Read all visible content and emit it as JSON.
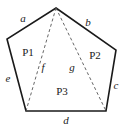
{
  "figure": {
    "canvas": {
      "width": 125,
      "height": 128,
      "background": "#ffffff"
    },
    "stroke_color": "#1a1a1a",
    "dash_color": "#555555",
    "text_color": "#1a1a1a",
    "outline_width": 1.6,
    "diagonal_width": 0.9,
    "diagonal_dash": "3,2.5",
    "vertices": [
      {
        "name": "apex",
        "x": 56,
        "y": 8
      },
      {
        "name": "right",
        "x": 116,
        "y": 50
      },
      {
        "name": "bottom-right",
        "x": 106,
        "y": 111
      },
      {
        "name": "bottom-left",
        "x": 26,
        "y": 111
      },
      {
        "name": "left",
        "x": 7,
        "y": 39
      }
    ],
    "outline_path": "M 56 8 L 116 50 L 106 111 L 26 111 L 7 39 Z",
    "diagonals": [
      {
        "name": "f",
        "path": "M 56 8 L 26 111"
      },
      {
        "name": "g",
        "path": "M 56 8 L 106 111"
      }
    ],
    "side_labels": [
      {
        "id": "a",
        "text": "a",
        "x": 23,
        "y": 18
      },
      {
        "id": "b",
        "text": "b",
        "x": 88,
        "y": 22
      },
      {
        "id": "c",
        "text": "c",
        "x": 116,
        "y": 85
      },
      {
        "id": "d",
        "text": "d",
        "x": 66,
        "y": 120
      },
      {
        "id": "e",
        "text": "e",
        "x": 8,
        "y": 78
      }
    ],
    "diagonal_labels": [
      {
        "id": "f",
        "text": "f",
        "x": 43,
        "y": 67
      },
      {
        "id": "g",
        "text": "g",
        "x": 72,
        "y": 67
      }
    ],
    "region_labels": [
      {
        "id": "P1",
        "text": "P1",
        "x": 28,
        "y": 52
      },
      {
        "id": "P2",
        "text": "P2",
        "x": 95,
        "y": 55
      },
      {
        "id": "P3",
        "text": "P3",
        "x": 62,
        "y": 91
      }
    ]
  }
}
